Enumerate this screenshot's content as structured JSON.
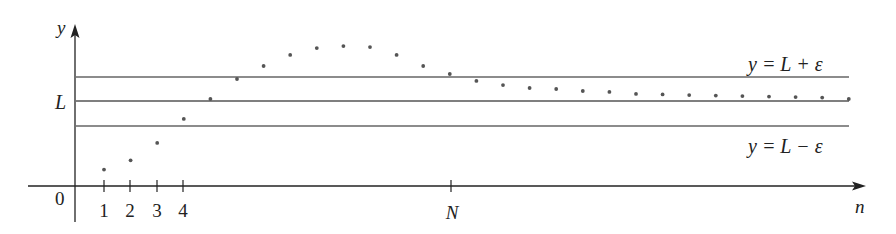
{
  "chart_data": {
    "type": "scatter",
    "title": "",
    "xlabel": "n",
    "ylabel": "y",
    "origin_label": "0",
    "x_ticks": [
      {
        "label": "1",
        "n": 1
      },
      {
        "label": "2",
        "n": 2
      },
      {
        "label": "3",
        "n": 3
      },
      {
        "label": "4",
        "n": 4
      },
      {
        "label": "N",
        "n": 15
      }
    ],
    "y_ticks": [
      {
        "label": "L",
        "y": 0
      }
    ],
    "horizontal_lines": [
      {
        "name": "upper-bound",
        "label": "y = L + ε",
        "y": 1.0,
        "style": "dashed"
      },
      {
        "name": "limit",
        "label": "",
        "y": 0.0,
        "style": "solid"
      },
      {
        "name": "lower-bound",
        "label": "y = L − ε",
        "y": -1.0,
        "style": "dashed"
      }
    ],
    "annotations": [
      "y = L + ε",
      "y = L − ε"
    ],
    "units_note": "y measured relative to L in units of ε (L at 0, L+ε at 1, L−ε at -1, x-axis at -3.5)",
    "series": [
      {
        "name": "a_n",
        "x": [
          1,
          2,
          3,
          4,
          5,
          6,
          7,
          8,
          9,
          10,
          11,
          12,
          13,
          14,
          15,
          16,
          17,
          18,
          19,
          20,
          21,
          22,
          23,
          24,
          25,
          26,
          27,
          28,
          29
        ],
        "y": [
          -2.8,
          -2.42,
          -1.71,
          -0.73,
          0.08,
          0.9,
          1.43,
          1.88,
          2.16,
          2.24,
          2.2,
          1.88,
          1.43,
          1.1,
          0.82,
          0.65,
          0.53,
          0.49,
          0.41,
          0.37,
          0.29,
          0.27,
          0.24,
          0.22,
          0.2,
          0.18,
          0.16,
          0.14,
          0.08
        ]
      }
    ],
    "xlim": [
      0,
      31
    ],
    "ylim": [
      -3.5,
      3.1
    ],
    "grid": false,
    "legend": "none"
  },
  "labels": {
    "y_axis": "y",
    "x_axis": "n",
    "origin": "0",
    "limit": "L",
    "upper": "y = L + ε",
    "lower": "y = L − ε",
    "tick1": "1",
    "tick2": "2",
    "tick3": "3",
    "tick4": "4",
    "tickN": "N"
  },
  "colors": {
    "axis": "#222222",
    "line": "#555555",
    "dot": "#555555"
  }
}
